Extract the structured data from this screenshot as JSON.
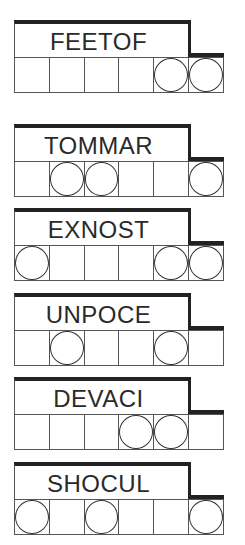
{
  "puzzles": [
    {
      "scramble": "FEETOF",
      "cells": 6,
      "circled": [
        5,
        6
      ],
      "top": 20
    },
    {
      "scramble": "TOMMAR",
      "cells": 6,
      "circled": [
        2,
        3,
        6
      ],
      "top": 124
    },
    {
      "scramble": "EXNOST",
      "cells": 6,
      "circled": [
        1,
        5,
        6
      ],
      "top": 208
    },
    {
      "scramble": "UNPOCE",
      "cells": 6,
      "circled": [
        2,
        5
      ],
      "top": 293
    },
    {
      "scramble": "DEVACI",
      "cells": 6,
      "circled": [
        4,
        5
      ],
      "top": 377
    },
    {
      "scramble": "SHOCUL",
      "cells": 6,
      "circled": [
        1,
        3,
        6
      ],
      "top": 462
    }
  ],
  "colors": {
    "line": "#222222",
    "text": "#2a2a2a",
    "background": "#ffffff"
  }
}
